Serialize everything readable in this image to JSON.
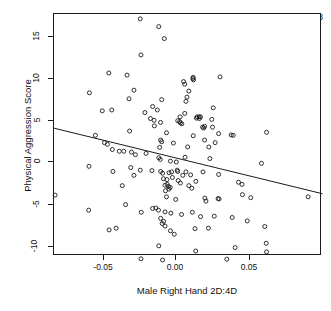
{
  "chart_data": {
    "type": "scatter",
    "title": "",
    "xlabel": "Male Right Hand 2D:4D",
    "ylabel": "Physical Aggression Score",
    "xlim": [
      -0.0835,
      0.1003
    ],
    "ylim": [
      -12.2,
      16.7
    ],
    "grid": false,
    "legend": null,
    "xticks": [
      -0.05,
      0.0,
      0.05
    ],
    "xticklabels": [
      "-0.05",
      "0.00",
      "0.05"
    ],
    "yticks": [
      -10,
      -5,
      0,
      5,
      10,
      15
    ],
    "yticklabels": [
      "-10",
      "-5",
      "0",
      "5",
      "10",
      "15"
    ],
    "annotations": [
      {
        "text": "Partial r = -0.21, p = 0.028",
        "x": 0.0345,
        "y": 15.3,
        "partial_r": -0.21,
        "p_value": 0.028
      }
    ],
    "marker": {
      "shape": "open-circle",
      "size": 4,
      "color": "#1a1a1a",
      "fill": "none"
    },
    "fit_line": {
      "type": "linear-regression",
      "color": "#1a1a1a",
      "x_start": -0.0835,
      "y_start": 3.93,
      "x_end": 0.1003,
      "y_end": -3.69,
      "slope": -41.5,
      "intercept": 0.46
    },
    "n_points": 150,
    "points": [
      [
        -0.0245,
        16.65
      ],
      [
        -0.0118,
        15.75
      ],
      [
        -0.008,
        14.35
      ],
      [
        -0.024,
        12.45
      ],
      [
        -0.046,
        10.35
      ],
      [
        -0.0335,
        10.1
      ],
      [
        0.0115,
        9.7
      ],
      [
        0.012,
        9.55
      ],
      [
        0.0118,
        9.85
      ],
      [
        0.0302,
        9.9
      ],
      [
        0.0052,
        9.35
      ],
      [
        0.006,
        9.05
      ],
      [
        -0.0593,
        8.05
      ],
      [
        -0.0288,
        8.35
      ],
      [
        0.0088,
        8.25
      ],
      [
        0.0075,
        7.55
      ],
      [
        -0.0322,
        7.35
      ],
      [
        -0.0098,
        7.25
      ],
      [
        0.0068,
        7.05
      ],
      [
        0.0255,
        6.3
      ],
      [
        -0.0505,
        5.95
      ],
      [
        -0.044,
        6.05
      ],
      [
        -0.0213,
        5.75
      ],
      [
        -0.016,
        6.45
      ],
      [
        -0.0128,
        6.05
      ],
      [
        0.0145,
        5.25
      ],
      [
        0.0158,
        5.25
      ],
      [
        0.0168,
        5.25
      ],
      [
        0.014,
        5.1
      ],
      [
        0.016,
        5.05
      ],
      [
        -0.0175,
        5.05
      ],
      [
        -0.015,
        4.85
      ],
      [
        -0.0106,
        4.6
      ],
      [
        0.0245,
        4.95
      ],
      [
        0.025,
        4.05
      ],
      [
        0.0012,
        4.8
      ],
      [
        0.0025,
        4.7
      ],
      [
        0.003,
        4.55
      ],
      [
        0.004,
        4.45
      ],
      [
        0.0182,
        4.05
      ],
      [
        0.019,
        3.95
      ],
      [
        0.0196,
        4.15
      ],
      [
        -0.0552,
        3.1
      ],
      [
        -0.0318,
        3.6
      ],
      [
        0.0378,
        3.15
      ],
      [
        0.0392,
        3.1
      ],
      [
        0.062,
        3.45
      ],
      [
        0.0292,
        3.3
      ],
      [
        -0.0065,
        3.4
      ],
      [
        -0.0105,
        2.55
      ],
      [
        -0.0098,
        2.35
      ],
      [
        -0.049,
        2.25
      ],
      [
        -0.047,
        2.05
      ],
      [
        -0.0436,
        1.45
      ],
      [
        -0.0388,
        1.25
      ],
      [
        -0.0358,
        1.25
      ],
      [
        -0.0305,
        1.15
      ],
      [
        -0.0278,
        0.85
      ],
      [
        -0.0112,
        1.7
      ],
      [
        0.008,
        1.75
      ],
      [
        -0.0118,
        0.5
      ],
      [
        -0.0108,
        0.3
      ],
      [
        -0.0038,
        0.1
      ],
      [
        0.0002,
        0.0
      ],
      [
        0.0232,
        0.4
      ],
      [
        0.0585,
        -0.15
      ],
      [
        -0.0596,
        -0.5
      ],
      [
        -0.031,
        -0.65
      ],
      [
        -0.0245,
        -0.95
      ],
      [
        -0.0432,
        -1.1
      ],
      [
        -0.0288,
        -1.55
      ],
      [
        -0.0165,
        -1.0
      ],
      [
        -0.0105,
        -1.1
      ],
      [
        -0.0092,
        -1.3
      ],
      [
        -0.0048,
        -1.25
      ],
      [
        -0.003,
        -1.15
      ],
      [
        0.0012,
        -1.1
      ],
      [
        0.0046,
        -1.55
      ],
      [
        0.0068,
        -1.15
      ],
      [
        0.01,
        -1.5
      ],
      [
        0.0292,
        -1.45
      ],
      [
        -0.0086,
        -1.95
      ],
      [
        -0.0062,
        -2.05
      ],
      [
        -0.0025,
        -1.8
      ],
      [
        0.0015,
        -2.15
      ],
      [
        0.0136,
        -2.25
      ],
      [
        0.0428,
        -2.35
      ],
      [
        0.0452,
        -2.6
      ],
      [
        -0.0368,
        -2.75
      ],
      [
        -0.0075,
        -2.7
      ],
      [
        -0.006,
        -2.6
      ],
      [
        -0.0052,
        -2.85
      ],
      [
        -0.004,
        -2.95
      ],
      [
        0.0108,
        -3.05
      ],
      [
        -0.0072,
        -3.35
      ],
      [
        0.0455,
        -3.8
      ],
      [
        0.0512,
        -4.15
      ],
      [
        0.0198,
        -4.2
      ],
      [
        0.0205,
        -4.55
      ],
      [
        0.0288,
        -4.25
      ],
      [
        0.0295,
        -4.3
      ],
      [
        0.0905,
        -4.05
      ],
      [
        -0.0828,
        -3.85
      ],
      [
        -0.0065,
        -4.05
      ],
      [
        -0.0345,
        -4.95
      ],
      [
        -0.0238,
        -5.85
      ],
      [
        -0.0598,
        -5.6
      ],
      [
        -0.016,
        -5.4
      ],
      [
        -0.0138,
        -5.35
      ],
      [
        -0.012,
        -5.6
      ],
      [
        -0.0075,
        -5.8
      ],
      [
        -0.0035,
        -5.95
      ],
      [
        0.0038,
        -6.1
      ],
      [
        0.0112,
        -5.85
      ],
      [
        0.0168,
        -6.35
      ],
      [
        0.0262,
        -6.3
      ],
      [
        0.0385,
        -6.45
      ],
      [
        0.0488,
        -6.85
      ],
      [
        -0.0105,
        -6.55
      ],
      [
        -0.0085,
        -6.9
      ],
      [
        -0.0458,
        -7.9
      ],
      [
        -0.041,
        -7.7
      ],
      [
        -0.0095,
        -7.15
      ],
      [
        -0.0075,
        -7.45
      ],
      [
        -0.0038,
        -8.0
      ],
      [
        -0.0012,
        -8.4
      ],
      [
        0.013,
        -7.75
      ],
      [
        0.0222,
        -7.7
      ],
      [
        0.0608,
        -7.5
      ],
      [
        -0.0118,
        -9.75
      ],
      [
        0.0135,
        -10.35
      ],
      [
        0.0405,
        -9.95
      ],
      [
        0.0618,
        -9.45
      ],
      [
        0.062,
        -10.45
      ],
      [
        -0.024,
        -11.25
      ],
      [
        -0.0092,
        -11.4
      ],
      [
        0.0348,
        -11.3
      ],
      [
        -0.0048,
        -3.15
      ],
      [
        0.003,
        -2.45
      ],
      [
        0.0185,
        -1.15
      ],
      [
        0.0062,
        0.55
      ],
      [
        -0.0018,
        2.2
      ],
      [
        0.0225,
        1.75
      ],
      [
        0.0268,
        2.25
      ],
      [
        0.0196,
        2.55
      ],
      [
        0.006,
        5.65
      ],
      [
        0.0028,
        5.25
      ],
      [
        -0.0148,
        4.2
      ],
      [
        0.0118,
        3.05
      ],
      [
        -0.0205,
        1.0
      ],
      [
        0.0008,
        -0.95
      ],
      [
        0.0088,
        -2.75
      ],
      [
        -0.0002,
        -4.35
      ]
    ]
  },
  "axes": {
    "xlabel": "Male Right Hand 2D:4D",
    "ylabel": "Physical Aggression Score"
  },
  "annotation": {
    "text": "Partial r = -0.21, p = 0.028"
  },
  "xticklabels": [
    "-0.05",
    "0.00",
    "0.05"
  ],
  "yticklabels": [
    "15",
    "10",
    "5",
    "0",
    "-5",
    "-10"
  ]
}
